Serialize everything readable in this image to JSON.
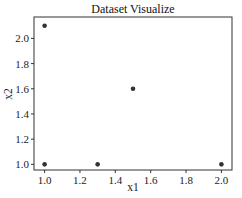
{
  "chart_data": {
    "type": "scatter",
    "title": "Dataset Visualize",
    "xlabel": "x1",
    "ylabel": "x2",
    "x": [
      1.0,
      1.0,
      1.3,
      1.5,
      2.0
    ],
    "y": [
      2.1,
      1.0,
      1.0,
      1.6,
      1.0
    ],
    "xlim": [
      0.94,
      2.06
    ],
    "ylim": [
      0.955,
      2.17
    ],
    "xticks": [
      1.0,
      1.2,
      1.4,
      1.6,
      1.8,
      2.0
    ],
    "xtick_labels": [
      "1.0",
      "1.2",
      "1.4",
      "1.6",
      "1.8",
      "2.0"
    ],
    "yticks": [
      1.0,
      1.2,
      1.4,
      1.6,
      1.8,
      2.0
    ],
    "ytick_labels": [
      "1.0",
      "1.2",
      "1.4",
      "1.6",
      "1.8",
      "2.0"
    ],
    "grid": false,
    "legend": null,
    "marker_color": "#333333"
  }
}
